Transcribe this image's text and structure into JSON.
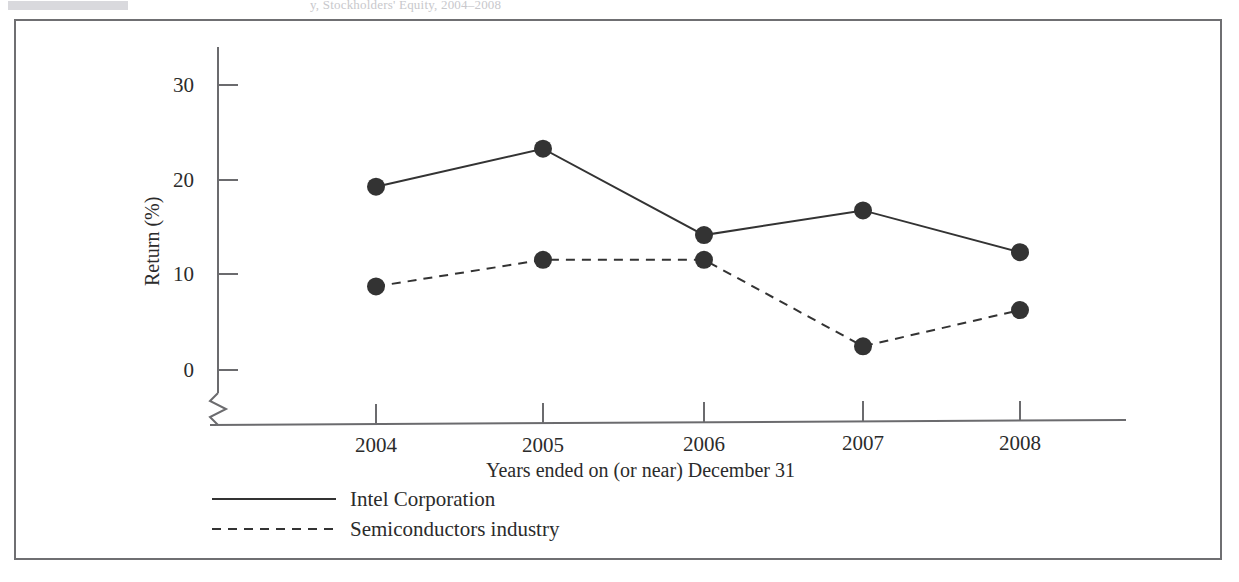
{
  "header": {
    "faded_caption": "y,                         Stockholders' Equity, 2004–2008"
  },
  "chart_data": {
    "type": "line",
    "title": "",
    "xlabel": "Years ended on (or near) December 31",
    "ylabel": "Return (%)",
    "categories": [
      "2004",
      "2005",
      "2006",
      "2007",
      "2008"
    ],
    "x_tick_labels": [
      "2004",
      "2005",
      "2006",
      "2007",
      "2008"
    ],
    "y_tick_labels": [
      "0",
      "10",
      "20",
      "30"
    ],
    "y_ticks": [
      0,
      10,
      20,
      30
    ],
    "ylim": [
      0,
      32
    ],
    "y_axis_break": true,
    "grid": false,
    "legend_position": "bottom-left",
    "series": [
      {
        "name": "Intel Corporation",
        "style": "solid",
        "marker": "filled-circle",
        "color": "#333333",
        "values": [
          19.3,
          23.3,
          14.2,
          16.8,
          12.4
        ]
      },
      {
        "name": "Semiconductors industry",
        "style": "dashed",
        "marker": "filled-circle",
        "color": "#333333",
        "values": [
          8.8,
          11.6,
          11.6,
          2.5,
          6.3
        ]
      }
    ]
  },
  "legend": {
    "items": [
      {
        "label": "Intel Corporation",
        "style": "solid"
      },
      {
        "label": "Semiconductors industry",
        "style": "dashed"
      }
    ]
  },
  "colors": {
    "frame": "#6f6f72",
    "axis": "#6b6b6e",
    "series": "#333333",
    "text": "#2b2b2b"
  }
}
